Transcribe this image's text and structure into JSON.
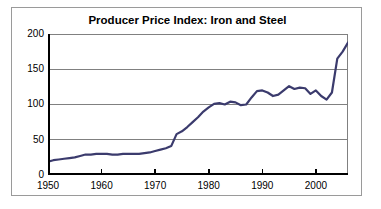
{
  "figure": {
    "title": "Producer Price Index: Iron and Steel",
    "frame_border_color": "#9a9a9a",
    "background_color": "#ffffff"
  },
  "chart_data": {
    "type": "line",
    "title": "Producer Price Index: Iron and Steel",
    "xlabel": "",
    "ylabel": "",
    "xlim": [
      1950,
      2006
    ],
    "ylim": [
      0,
      200
    ],
    "xticks": [
      1950,
      1960,
      1970,
      1980,
      1990,
      2000
    ],
    "xtick_labels": [
      "1950",
      "1960",
      "1970",
      "1980",
      "1990",
      "2000"
    ],
    "yticks": [
      0,
      50,
      100,
      150,
      200
    ],
    "ytick_labels": [
      "0",
      "50",
      "100",
      "150",
      "200"
    ],
    "grid": "horizontal",
    "legend": "none",
    "line_color": "#3b3b6d",
    "line_width": 2.2,
    "series": [
      {
        "name": "Producer Price Index: Iron and Steel",
        "x": [
          1950,
          1951,
          1952,
          1953,
          1954,
          1955,
          1956,
          1957,
          1958,
          1959,
          1960,
          1961,
          1962,
          1963,
          1964,
          1965,
          1966,
          1967,
          1968,
          1969,
          1970,
          1971,
          1972,
          1973,
          1974,
          1975,
          1976,
          1977,
          1978,
          1979,
          1980,
          1981,
          1982,
          1983,
          1984,
          1985,
          1986,
          1987,
          1988,
          1989,
          1990,
          1991,
          1992,
          1993,
          1994,
          1995,
          1996,
          1997,
          1998,
          1999,
          2000,
          2001,
          2002,
          2003,
          2004,
          2005,
          2006
        ],
        "values": [
          19,
          21,
          22,
          23,
          24,
          25,
          27,
          29,
          29,
          30,
          30,
          30,
          29,
          29,
          30,
          30,
          30,
          30,
          31,
          32,
          34,
          36,
          38,
          41,
          58,
          62,
          68,
          75,
          82,
          90,
          96,
          101,
          102,
          100,
          104,
          103,
          99,
          100,
          110,
          119,
          120,
          117,
          112,
          114,
          120,
          126,
          122,
          124,
          123,
          115,
          120,
          112,
          107,
          117,
          165,
          175,
          188
        ]
      }
    ],
    "annotations": []
  },
  "axes": {
    "y_labels": [
      "200",
      "150",
      "100",
      "50",
      "0"
    ],
    "x_labels": [
      "1950",
      "1960",
      "1970",
      "1980",
      "1990",
      "2000"
    ]
  }
}
